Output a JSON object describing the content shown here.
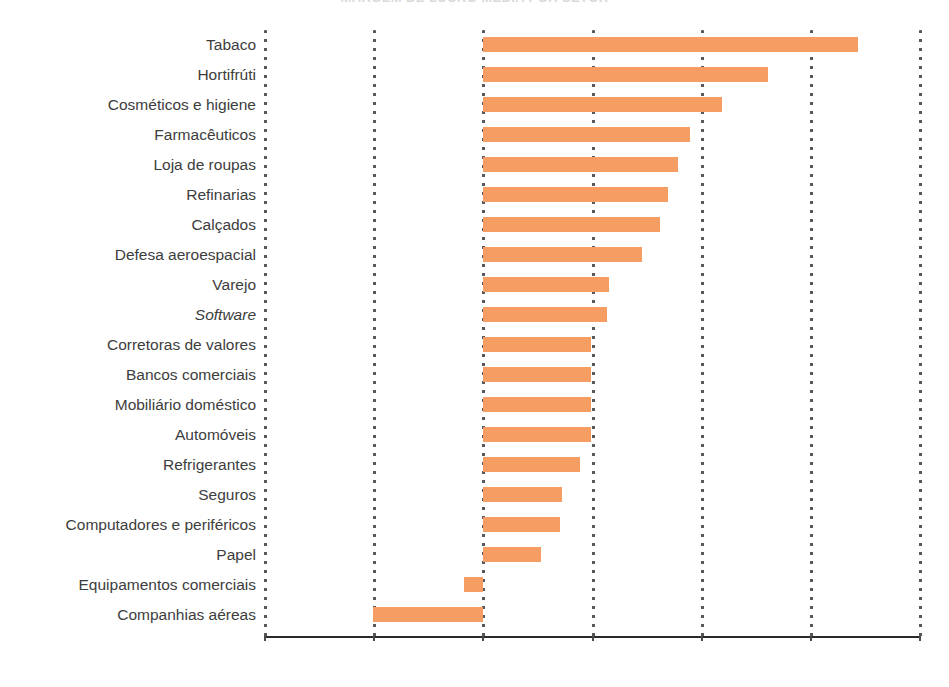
{
  "figure": {
    "title": "MARGEM DE LUCRO MEDIA POR SETOR",
    "bar_color": "#f59d62",
    "gridline_color": "#58585c",
    "axis_color": "#2b2b2b"
  },
  "chart_data": {
    "type": "bar",
    "orientation": "horizontal",
    "title": "MARGEM DE LUCRO MEDIA POR SETOR",
    "xlabel": "",
    "ylabel": "",
    "xlim": [
      -20,
      40
    ],
    "grid": true,
    "legend": null,
    "xticks": [
      -20,
      -10,
      0,
      10,
      20,
      30,
      40
    ],
    "xticklabels": [
      "",
      "",
      "",
      "",
      "",
      "",
      ""
    ],
    "categories": [
      "Tabaco",
      "Hortifrúti",
      "Cosméticos e higiene",
      "Farmacêuticos",
      "Loja de roupas",
      "Refinarias",
      "Calçados",
      "Defesa aeroespacial",
      "Varejo",
      "Software",
      "Corretoras de valores",
      "Bancos comerciais",
      "Mobiliário doméstico",
      "Automóveis",
      "Refrigerantes",
      "Seguros",
      "Computadores e periféricos",
      "Papel",
      "Equipamentos comerciais",
      "Companhias aéreas"
    ],
    "italic_categories": [
      "Software"
    ],
    "values": [
      34.3,
      26.1,
      21.9,
      18.9,
      17.8,
      16.9,
      16.2,
      14.5,
      11.5,
      11.3,
      9.9,
      9.9,
      9.9,
      9.9,
      8.9,
      7.2,
      7.0,
      5.3,
      -1.8,
      -10.1
    ]
  }
}
